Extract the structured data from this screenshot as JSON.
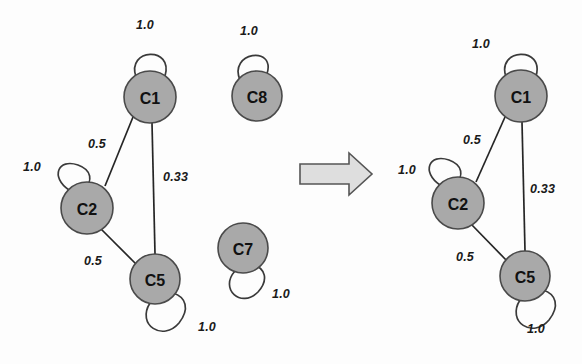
{
  "figure": {
    "type": "graph-transition-diagram",
    "background_color": "#fdfdfd",
    "node_fill_color": "#a9a9a9",
    "node_stroke_color": "#4a4a4a",
    "edge_color": "#262626",
    "arrow_fill_color": "#dedede",
    "arrow_stroke_color": "#555555"
  },
  "left_graph": {
    "name": "before-graph",
    "nodes": [
      {
        "id": "C1",
        "label": "C1",
        "cx": 150,
        "cy": 97,
        "r": 26
      },
      {
        "id": "C2",
        "label": "C2",
        "cx": 87,
        "cy": 208,
        "r": 26
      },
      {
        "id": "C5",
        "label": "C5",
        "cx": 155,
        "cy": 279,
        "r": 25
      },
      {
        "id": "C8",
        "label": "C8",
        "cx": 257,
        "cy": 96,
        "r": 25
      },
      {
        "id": "C7",
        "label": "C7",
        "cx": 243,
        "cy": 248,
        "r": 25
      }
    ],
    "edges": [
      {
        "from": "C1",
        "to": "C2",
        "weight": "0.5",
        "label_x": 88,
        "label_y": 137
      },
      {
        "from": "C1",
        "to": "C5",
        "weight": "0.33",
        "label_x": 163,
        "label_y": 170
      },
      {
        "from": "C2",
        "to": "C5",
        "weight": "0.5",
        "label_x": 84,
        "label_y": 254
      }
    ],
    "self_loops": [
      {
        "node": "C1",
        "weight": "1.0",
        "label_x": 136,
        "label_y": 18,
        "direction": "top"
      },
      {
        "node": "C2",
        "weight": "1.0",
        "label_x": 23,
        "label_y": 160,
        "direction": "top-left"
      },
      {
        "node": "C5",
        "weight": "1.0",
        "label_x": 198,
        "label_y": 320,
        "direction": "bottom-right"
      },
      {
        "node": "C8",
        "weight": "1.0",
        "label_x": 240,
        "label_y": 24,
        "direction": "top-left"
      },
      {
        "node": "C7",
        "weight": "1.0",
        "label_x": 272,
        "label_y": 287,
        "direction": "bottom-left"
      }
    ]
  },
  "transition_arrow": {
    "name": "transition-arrow",
    "x": 300,
    "y": 153,
    "width": 72,
    "height": 42
  },
  "right_graph": {
    "name": "after-graph",
    "nodes": [
      {
        "id": "C1",
        "label": "C1",
        "cx": 521,
        "cy": 96,
        "r": 26
      },
      {
        "id": "C2",
        "label": "C2",
        "cx": 458,
        "cy": 203,
        "r": 26
      },
      {
        "id": "C5",
        "label": "C5",
        "cx": 525,
        "cy": 276,
        "r": 25
      }
    ],
    "edges": [
      {
        "from": "C1",
        "to": "C2",
        "weight": "0.5",
        "label_x": 463,
        "label_y": 133
      },
      {
        "from": "C1",
        "to": "C5",
        "weight": "0.33",
        "label_x": 530,
        "label_y": 182
      },
      {
        "from": "C2",
        "to": "C5",
        "weight": "0.5",
        "label_x": 456,
        "label_y": 250
      }
    ],
    "self_loops": [
      {
        "node": "C1",
        "weight": "1.0",
        "label_x": 472,
        "label_y": 37,
        "direction": "top-right"
      },
      {
        "node": "C2",
        "weight": "1.0",
        "label_x": 398,
        "label_y": 163,
        "direction": "top-left"
      },
      {
        "node": "C5",
        "weight": "1.0",
        "label_x": 527,
        "label_y": 322,
        "direction": "bottom-right"
      }
    ]
  }
}
